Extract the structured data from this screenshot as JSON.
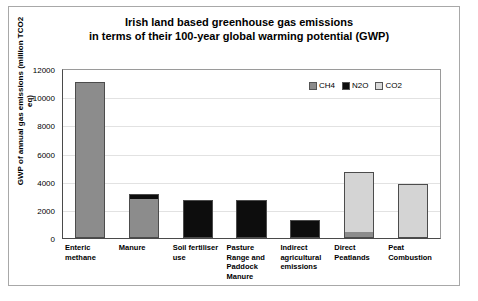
{
  "chart_data": {
    "type": "bar",
    "subtype": "stacked-vertical",
    "title": "Irish land based greenhouse gas emissions in terms of their 100-year global warming potential (GWP)",
    "title_lines": [
      "Irish land based greenhouse gas emissions",
      "in terms of their 100-year global warming potential (GWP)"
    ],
    "xlabel": "",
    "ylabel": "GWP of annual gas emissions (million TCO2 eq)",
    "ylim": [
      0,
      12000
    ],
    "ytick_values": [
      0,
      2000,
      4000,
      6000,
      8000,
      10000,
      12000
    ],
    "ytick_labels": [
      "0",
      "2000",
      "4000",
      "6000",
      "8000",
      "10000",
      "12000"
    ],
    "grid": "horizontal",
    "legend_position": "inside-top-right",
    "categories": [
      "Enteric methane",
      "Manure",
      "Soil fertiliser use",
      "Pasture Range and Paddock Manure",
      "Indirect agricultural emissions",
      "Direct Peatlands",
      "Peat Combustion"
    ],
    "series": [
      {
        "name": "CH4",
        "color": "#8c8c8c",
        "values": [
          11100,
          2800,
          0,
          0,
          0,
          350,
          0
        ]
      },
      {
        "name": "N2O",
        "color": "#0d0d0d",
        "values": [
          0,
          300,
          2700,
          2700,
          1300,
          0,
          0
        ]
      },
      {
        "name": "CO2",
        "color": "#d4d4d4",
        "values": [
          0,
          0,
          0,
          0,
          0,
          4350,
          3800
        ]
      }
    ],
    "totals": [
      11100,
      3100,
      2700,
      2700,
      1300,
      4700,
      3800
    ]
  }
}
